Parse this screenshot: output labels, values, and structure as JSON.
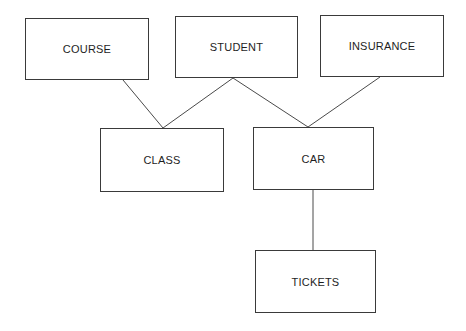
{
  "diagram": {
    "type": "entity-hierarchy",
    "nodes": [
      {
        "id": "course",
        "label": "COURSE",
        "x": 25,
        "y": 18,
        "w": 124,
        "h": 62
      },
      {
        "id": "student",
        "label": "STUDENT",
        "x": 175,
        "y": 16,
        "w": 123,
        "h": 62
      },
      {
        "id": "insurance",
        "label": "INSURANCE",
        "x": 320,
        "y": 15,
        "w": 124,
        "h": 62
      },
      {
        "id": "class",
        "label": "CLASS",
        "x": 100,
        "y": 128,
        "w": 124,
        "h": 64
      },
      {
        "id": "car",
        "label": "CAR",
        "x": 253,
        "y": 127,
        "w": 121,
        "h": 63
      },
      {
        "id": "tickets",
        "label": "TICKETS",
        "x": 255,
        "y": 250,
        "w": 121,
        "h": 63
      }
    ],
    "edges": [
      {
        "from": "course",
        "to": "class",
        "x1": 123,
        "y1": 80,
        "x2": 163,
        "y2": 128
      },
      {
        "from": "student",
        "to": "class",
        "x1": 233,
        "y1": 78,
        "x2": 163,
        "y2": 128
      },
      {
        "from": "student",
        "to": "car",
        "x1": 233,
        "y1": 78,
        "x2": 308,
        "y2": 127
      },
      {
        "from": "insurance",
        "to": "car",
        "x1": 380,
        "y1": 77,
        "x2": 308,
        "y2": 127
      },
      {
        "from": "car",
        "to": "tickets",
        "x1": 313,
        "y1": 190,
        "x2": 313,
        "y2": 250
      }
    ]
  }
}
